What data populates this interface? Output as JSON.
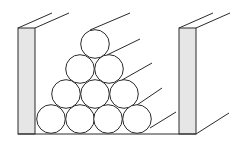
{
  "diagram": {
    "colors": {
      "stroke": "#2a2a2a",
      "wall_fill": "#e6e6e6",
      "background": "#ffffff",
      "cylinder_fill": "#ffffff"
    },
    "cylinder_radius": 14.3,
    "walls": [
      {
        "name": "left-wall",
        "x": 18,
        "y": 28,
        "w": 17,
        "h": 106,
        "depth": [
          [
            18,
            28
          ],
          [
            52,
            13
          ]
        ],
        "depth2": [
          [
            35,
            28
          ],
          [
            69,
            13
          ]
        ]
      },
      {
        "name": "right-wall",
        "x": 179,
        "y": 28,
        "w": 17,
        "h": 106,
        "depth": [
          [
            179,
            28
          ],
          [
            213,
            13
          ]
        ],
        "depth2": [
          [
            196,
            28
          ],
          [
            230,
            13
          ]
        ]
      }
    ],
    "floor": {
      "x1": 18,
      "x2": 196,
      "y": 134,
      "extend": [
        [
          196,
          134
        ],
        [
          229,
          113
        ]
      ]
    },
    "rows": [
      {
        "row": 1,
        "centers": [
          [
            95,
            44
          ]
        ]
      },
      {
        "row": 2,
        "centers": [
          [
            80,
            69
          ],
          [
            109,
            69
          ]
        ]
      },
      {
        "row": 3,
        "centers": [
          [
            66,
            94
          ],
          [
            95,
            94
          ],
          [
            124,
            94
          ]
        ]
      },
      {
        "row": 4,
        "centers": [
          [
            51,
            119
          ],
          [
            80,
            119
          ],
          [
            108,
            119
          ],
          [
            137,
            119
          ]
        ]
      }
    ],
    "depth_lines": [
      [
        [
          90,
          30
        ],
        [
          130,
          13
        ]
      ],
      [
        [
          107,
          55
        ],
        [
          140,
          39
        ]
      ],
      [
        [
          122,
          80
        ],
        [
          152,
          63
        ]
      ],
      [
        [
          137,
          105
        ],
        [
          162,
          88
        ]
      ],
      [
        [
          150,
          128
        ],
        [
          176,
          112
        ]
      ]
    ]
  }
}
